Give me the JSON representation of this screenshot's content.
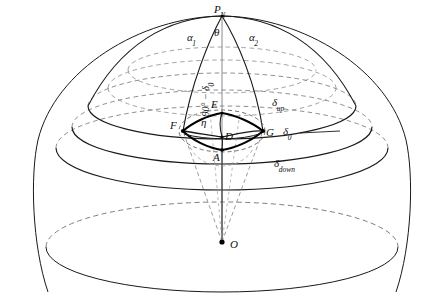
{
  "figure": {
    "title_faint": "",
    "points": {
      "north_pole": "P",
      "north_pole_sub": "N",
      "center": "O",
      "top_vertex": "E",
      "left_vertex": "F",
      "right_vertex": "G",
      "bottom_vertex": "A",
      "inner_vertex": "D"
    },
    "angles": {
      "alpha_left": "α",
      "alpha_left_sub": "1",
      "alpha_right": "α",
      "alpha_right_sub": "2",
      "theta": "θ",
      "eta": "η"
    },
    "declinations": {
      "colatitude": "90° − δ",
      "colatitude_sub": "0",
      "delta_up": "δ",
      "delta_up_sub": "up",
      "delta_zero": "δ",
      "delta_zero_sub": "0",
      "delta_down": "δ",
      "delta_down_sub": "down"
    },
    "colors": {
      "stroke": "#1a1a1a",
      "dashed": "#6f6f6f",
      "background": "#ffffff"
    }
  }
}
